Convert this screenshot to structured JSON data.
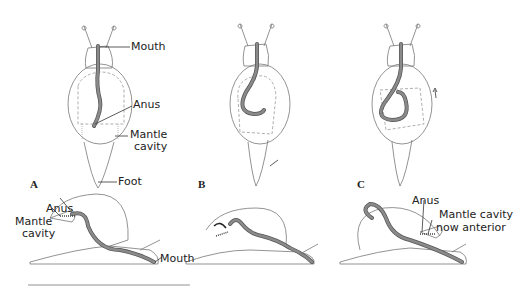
{
  "diagram": {
    "panels": [
      {
        "id": "A",
        "label": "A",
        "top_view_labels": {
          "mouth": "Mouth",
          "anus": "Anus",
          "mantle_cavity": "Mantle\ncavity",
          "foot": "Foot"
        },
        "side_view_labels": {
          "anus": "Anus",
          "mantle_cavity": "Mantle\ncavity",
          "mouth": "Mouth"
        }
      },
      {
        "id": "B",
        "label": "B"
      },
      {
        "id": "C",
        "label": "C",
        "side_view_labels": {
          "anus": "Anus",
          "mantle_cavity": "Mantle cavity\nnow anterior"
        }
      }
    ],
    "colors": {
      "gut": "#8a8a8a",
      "gut_outline": "#555555",
      "outline": "#777777",
      "dashed": "#999999"
    }
  },
  "labels": {
    "a_mouth": "Mouth",
    "a_anus": "Anus",
    "a_mantle1": "Mantle",
    "a_mantle2": "cavity",
    "a_foot": "Foot",
    "panel_a": "A",
    "panel_b": "B",
    "panel_c": "C",
    "as_anus": "Anus",
    "as_mantle1": "Mantle",
    "as_mantle2": "cavity",
    "as_mouth": "Mouth",
    "cs_anus": "Anus",
    "cs_mantle1": "Mantle cavity",
    "cs_mantle2": "now anterior"
  }
}
